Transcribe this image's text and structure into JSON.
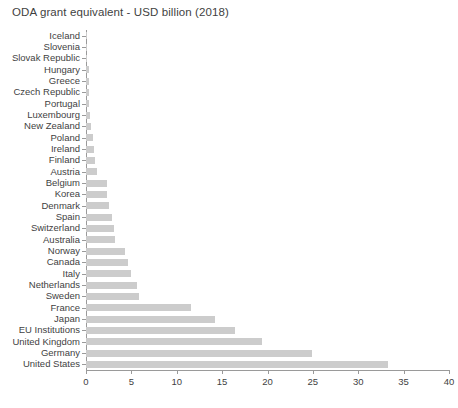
{
  "chart_data": {
    "type": "bar",
    "orientation": "horizontal",
    "title": "ODA grant equivalent - USD billion (2018)",
    "xlabel": "",
    "ylabel": "",
    "xlim": [
      0,
      40
    ],
    "xticks": [
      0,
      5,
      10,
      15,
      20,
      25,
      30,
      35,
      40
    ],
    "grid": false,
    "legend": null,
    "bar_color": "#cccccc",
    "axis_color": "#9a9a9a",
    "text_color": "#3f3f3f",
    "categories": [
      "Iceland",
      "Slovenia",
      "Slovak Republic",
      "Hungary",
      "Greece",
      "Czech Republic",
      "Portugal",
      "Luxembourg",
      "New Zealand",
      "Poland",
      "Ireland",
      "Finland",
      "Austria",
      "Belgium",
      "Korea",
      "Denmark",
      "Spain",
      "Switzerland",
      "Australia",
      "Norway",
      "Canada",
      "Italy",
      "Netherlands",
      "Sweden",
      "France",
      "Japan",
      "EU Institutions",
      "United Kingdom",
      "Germany",
      "United States"
    ],
    "values": [
      0.07,
      0.09,
      0.12,
      0.28,
      0.3,
      0.31,
      0.36,
      0.45,
      0.55,
      0.76,
      0.93,
      0.98,
      1.18,
      2.26,
      2.36,
      2.57,
      2.87,
      3.11,
      3.16,
      4.26,
      4.67,
      5.0,
      5.66,
      5.84,
      11.6,
      14.2,
      16.4,
      19.4,
      24.9,
      33.3
    ]
  }
}
